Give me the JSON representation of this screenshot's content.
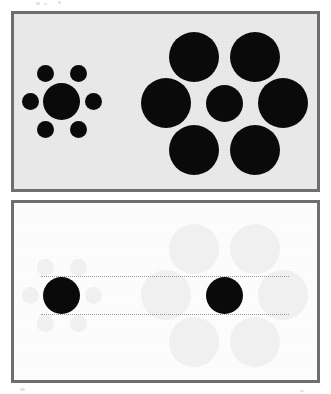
{
  "figure": {
    "name": "Ebbinghaus illusion",
    "canvas_width": 331,
    "canvas_height": 394,
    "page_background": "#ffffff"
  },
  "colors": {
    "panel_border": "#6e6e6e",
    "panel_a_background": "#e9e9e9",
    "panel_b_background": "#fdfdfd",
    "circle_solid": "#0a0a0a",
    "circle_faded": "#f0f0f0",
    "guide_line": "#9a9a9a",
    "speck": "#c9c9c9"
  },
  "panels": [
    {
      "id": "panel-a",
      "label": "Ebbinghaus illusion stimulus panel",
      "x": 11,
      "y": 11,
      "width": 309,
      "height": 181,
      "border_width": 3,
      "background": "#e9e9e9",
      "clusters": [
        {
          "id": "left-cluster",
          "label": "central disc surrounded by small inducers",
          "center_circle": {
            "cx": 61,
            "cy": 101,
            "r": 18.5,
            "fill": "#0a0a0a"
          },
          "surrounding_count": 6,
          "surrounding_radius": 8.5,
          "surrounding_fill": "#0a0a0a",
          "surrounding": [
            {
              "cx": 45,
              "cy": 73,
              "r": 8.5
            },
            {
              "cx": 78,
              "cy": 73,
              "r": 8.5
            },
            {
              "cx": 30,
              "cy": 101,
              "r": 8.5
            },
            {
              "cx": 93,
              "cy": 101,
              "r": 8.5
            },
            {
              "cx": 45,
              "cy": 129,
              "r": 8.5
            },
            {
              "cx": 78,
              "cy": 129,
              "r": 8.5
            }
          ]
        },
        {
          "id": "right-cluster",
          "label": "central disc surrounded by large inducers",
          "center_circle": {
            "cx": 224,
            "cy": 103,
            "r": 18.5,
            "fill": "#0a0a0a"
          },
          "surrounding_count": 6,
          "surrounding_radius": 25,
          "surrounding_fill": "#0a0a0a",
          "surrounding": [
            {
              "cx": 194,
              "cy": 57,
              "r": 25
            },
            {
              "cx": 255,
              "cy": 57,
              "r": 25
            },
            {
              "cx": 166,
              "cy": 103,
              "r": 25
            },
            {
              "cx": 283,
              "cy": 103,
              "r": 25
            },
            {
              "cx": 194,
              "cy": 150,
              "r": 25
            },
            {
              "cx": 255,
              "cy": 150,
              "r": 25
            }
          ]
        }
      ],
      "guide_lines": []
    },
    {
      "id": "panel-b",
      "label": "Comparison panel with inducers faded and dotted size guides",
      "x": 11,
      "y": 200,
      "width": 309,
      "height": 183,
      "border_width": 3,
      "background": "#fdfdfd",
      "clusters": [
        {
          "id": "left-cluster-faded",
          "label": "central disc with faded small inducers",
          "center_circle": {
            "cx": 61,
            "cy": 295,
            "r": 18.5,
            "fill": "#0a0a0a"
          },
          "surrounding_count": 6,
          "surrounding_radius": 8.5,
          "surrounding_fill": "#f0f0f0",
          "surrounding": [
            {
              "cx": 45,
              "cy": 267,
              "r": 8.5
            },
            {
              "cx": 78,
              "cy": 267,
              "r": 8.5
            },
            {
              "cx": 30,
              "cy": 295,
              "r": 8.5
            },
            {
              "cx": 93,
              "cy": 295,
              "r": 8.5
            },
            {
              "cx": 45,
              "cy": 323,
              "r": 8.5
            },
            {
              "cx": 78,
              "cy": 323,
              "r": 8.5
            }
          ]
        },
        {
          "id": "right-cluster-faded",
          "label": "central disc with faded large inducers",
          "center_circle": {
            "cx": 224,
            "cy": 295,
            "r": 18.5,
            "fill": "#0a0a0a"
          },
          "surrounding_count": 6,
          "surrounding_radius": 25,
          "surrounding_fill": "#f0f0f0",
          "surrounding": [
            {
              "cx": 194,
              "cy": 249,
              "r": 25
            },
            {
              "cx": 255,
              "cy": 249,
              "r": 25
            },
            {
              "cx": 166,
              "cy": 295,
              "r": 25
            },
            {
              "cx": 283,
              "cy": 295,
              "r": 25
            },
            {
              "cx": 194,
              "cy": 342,
              "r": 25
            },
            {
              "cx": 255,
              "cy": 342,
              "r": 25
            }
          ]
        }
      ],
      "guide_lines": [
        {
          "id": "guide-top",
          "x1": 41,
          "x2": 289,
          "y": 276,
          "style": "dotted",
          "color": "#9a9a9a"
        },
        {
          "id": "guide-bottom",
          "x1": 41,
          "x2": 289,
          "y": 314,
          "style": "dotted",
          "color": "#9a9a9a"
        }
      ]
    }
  ],
  "artifacts": {
    "scan_specks": [
      {
        "x": 36,
        "y": 2,
        "w": 4,
        "h": 3
      },
      {
        "x": 44,
        "y": 3,
        "w": 3,
        "h": 2
      },
      {
        "x": 58,
        "y": 1,
        "w": 3,
        "h": 3
      },
      {
        "x": 20,
        "y": 388,
        "w": 5,
        "h": 3
      },
      {
        "x": 300,
        "y": 390,
        "w": 4,
        "h": 2
      }
    ]
  }
}
